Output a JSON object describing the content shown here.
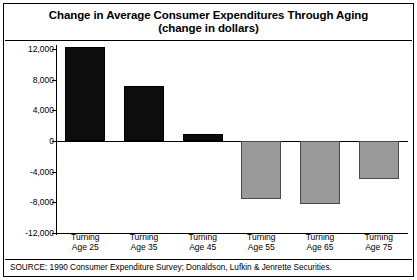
{
  "chart_data": {
    "type": "bar",
    "title": "Change in Average Consumer Expenditures Through Aging",
    "subtitle": "(change in dollars)",
    "xlabel": "",
    "ylabel": "",
    "ylim": [
      -12000,
      12000
    ],
    "ytick_labels": [
      "12,000",
      "8,000",
      "4,000",
      "0",
      "-4,000",
      "-8,000",
      "-12,000"
    ],
    "ytick_values": [
      12000,
      8000,
      4000,
      0,
      -4000,
      -8000,
      -12000
    ],
    "grid": false,
    "legend": null,
    "categories": [
      "Turning\nAge 25",
      "Turning\nAge 35",
      "Turning\nAge 45",
      "Turning\nAge 55",
      "Turning\nAge 65",
      "Turning\nAge 75"
    ],
    "category_lines": [
      [
        "Turning",
        "Age 25"
      ],
      [
        "Turning",
        "Age 35"
      ],
      [
        "Turning",
        "Age 45"
      ],
      [
        "Turning",
        "Age 55"
      ],
      [
        "Turning",
        "Age 65"
      ],
      [
        "Turning",
        "Age 75"
      ]
    ],
    "values": [
      12200,
      7200,
      900,
      -7600,
      -8200,
      -5000
    ],
    "bar_colors": [
      "#0d0d0d",
      "#0d0d0d",
      "#0d0d0d",
      "#9a9a9a",
      "#9a9a9a",
      "#9a9a9a"
    ],
    "positive_color": "#0d0d0d",
    "negative_color": "#9a9a9a",
    "source": "SOURCE: 1990 Consumer Expenditure Survey; Donaldson, Lufkin & Jenrette Securities."
  }
}
